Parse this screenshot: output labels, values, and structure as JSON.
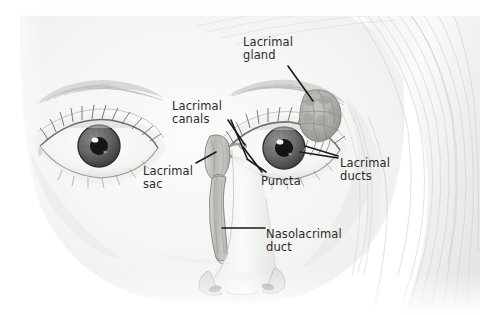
{
  "figure": {
    "kind": "anatomical-illustration",
    "medium": "pencil drawing, greyscale",
    "background_color": "#ffffff",
    "label_color": "#2b2b2b",
    "leader_color": "#1a1a1a"
  },
  "labels": {
    "lacrimal_gland": "Lacrimal\ngland",
    "lacrimal_canals": "Lacrimal\ncanals",
    "lacrimal_sac": "Lacrimal\nsac",
    "puncta": "Puncta",
    "lacrimal_ducts": "Lacrimal\nducts",
    "nasolacrimal_duct": "Nasolacrimal\nduct"
  },
  "parts": [
    {
      "id": "lacrimal-gland",
      "label": "Lacrimal gland"
    },
    {
      "id": "lacrimal-canals",
      "label": "Lacrimal canals"
    },
    {
      "id": "lacrimal-sac",
      "label": "Lacrimal sac"
    },
    {
      "id": "puncta",
      "label": "Puncta"
    },
    {
      "id": "lacrimal-ducts",
      "label": "Lacrimal ducts"
    },
    {
      "id": "nasolacrimal-duct",
      "label": "Nasolacrimal duct"
    }
  ],
  "anatomy_features": [
    "left eye",
    "right eye",
    "eyebrows",
    "eyelashes",
    "iris",
    "pupil",
    "nose",
    "nostrils",
    "hair"
  ]
}
